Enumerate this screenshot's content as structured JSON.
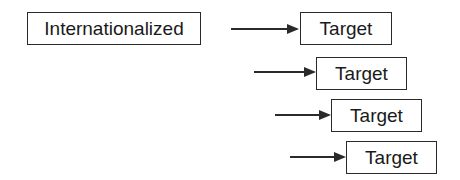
{
  "source": {
    "label": "Internationalized"
  },
  "targets": [
    {
      "label": "Target"
    },
    {
      "label": "Target"
    },
    {
      "label": "Target"
    },
    {
      "label": "Target"
    }
  ],
  "colors": {
    "stroke": "#2a2a2a",
    "text": "#1a1a1a",
    "background": "#ffffff"
  }
}
